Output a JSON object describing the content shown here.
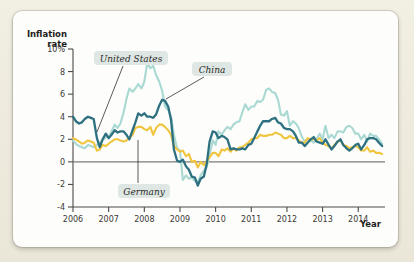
{
  "chart_data": {
    "type": "line",
    "title": "",
    "xlabel": "Year",
    "ylabel": "Inflation rate",
    "xlim": [
      2006.0,
      2014.75
    ],
    "ylim": [
      -4,
      10
    ],
    "grid": false,
    "legend_position": "inline-annotations",
    "y_ticks": [
      "10%",
      "8",
      "6",
      "4",
      "2",
      "0",
      "-2",
      "-4"
    ],
    "y_tick_values": [
      10,
      8,
      6,
      4,
      2,
      0,
      -2,
      -4
    ],
    "x_ticks": [
      "2006",
      "2007",
      "2008",
      "2009",
      "2010",
      "2011",
      "2012",
      "2013",
      "2014"
    ],
    "x_tick_values": [
      2006,
      2007,
      2008,
      2009,
      2010,
      2011,
      2012,
      2013,
      2014
    ],
    "annotations": [
      {
        "label": "United States",
        "series": "United States"
      },
      {
        "label": "China",
        "series": "China"
      },
      {
        "label": "Germany",
        "series": "Germany"
      }
    ],
    "series": [
      {
        "name": "United States",
        "color": "#2d7080",
        "x": [
          2006.0,
          2006.08,
          2006.17,
          2006.25,
          2006.33,
          2006.42,
          2006.5,
          2006.58,
          2006.67,
          2006.75,
          2006.83,
          2006.92,
          2007.0,
          2007.08,
          2007.17,
          2007.25,
          2007.33,
          2007.42,
          2007.5,
          2007.58,
          2007.67,
          2007.75,
          2007.83,
          2007.92,
          2008.0,
          2008.08,
          2008.17,
          2008.25,
          2008.33,
          2008.42,
          2008.5,
          2008.58,
          2008.67,
          2008.75,
          2008.83,
          2008.92,
          2009.0,
          2009.08,
          2009.17,
          2009.25,
          2009.33,
          2009.42,
          2009.5,
          2009.58,
          2009.67,
          2009.75,
          2009.83,
          2009.92,
          2010.0,
          2010.08,
          2010.17,
          2010.25,
          2010.33,
          2010.42,
          2010.5,
          2010.58,
          2010.67,
          2010.75,
          2010.83,
          2010.92,
          2011.0,
          2011.08,
          2011.17,
          2011.25,
          2011.33,
          2011.42,
          2011.5,
          2011.58,
          2011.67,
          2011.75,
          2011.83,
          2011.92,
          2012.0,
          2012.08,
          2012.17,
          2012.25,
          2012.33,
          2012.42,
          2012.5,
          2012.58,
          2012.67,
          2012.75,
          2012.83,
          2012.92,
          2013.0,
          2013.08,
          2013.17,
          2013.25,
          2013.33,
          2013.42,
          2013.5,
          2013.58,
          2013.67,
          2013.75,
          2013.83,
          2013.92,
          2014.0,
          2014.08,
          2014.17,
          2014.25,
          2014.33,
          2014.42,
          2014.5,
          2014.58,
          2014.67
        ],
        "values": [
          4.0,
          3.6,
          3.4,
          3.5,
          3.8,
          4.0,
          3.9,
          3.8,
          2.1,
          1.3,
          2.0,
          2.5,
          2.1,
          2.4,
          2.8,
          2.6,
          2.7,
          2.7,
          2.4,
          2.0,
          2.8,
          3.5,
          4.3,
          4.1,
          4.3,
          4.0,
          4.0,
          3.9,
          4.2,
          5.0,
          5.5,
          5.4,
          4.9,
          3.7,
          1.1,
          0.1,
          0.0,
          0.2,
          -0.4,
          -0.7,
          -1.3,
          -1.4,
          -2.1,
          -1.5,
          -1.3,
          -0.2,
          1.8,
          2.7,
          2.6,
          2.1,
          2.3,
          2.2,
          2.0,
          1.1,
          1.2,
          1.1,
          1.1,
          1.2,
          1.1,
          1.5,
          1.6,
          2.1,
          2.7,
          3.2,
          3.6,
          3.6,
          3.6,
          3.8,
          3.9,
          3.5,
          3.4,
          3.0,
          2.9,
          2.9,
          2.7,
          2.3,
          1.7,
          1.7,
          1.4,
          1.7,
          2.0,
          2.2,
          1.8,
          1.7,
          1.6,
          2.0,
          1.5,
          1.1,
          1.4,
          1.8,
          2.0,
          1.5,
          1.2,
          1.0,
          1.2,
          1.5,
          1.6,
          1.1,
          1.5,
          2.0,
          2.1,
          2.1,
          2.0,
          1.7,
          1.4
        ]
      },
      {
        "name": "China",
        "color": "#a9d9d2",
        "x": [
          2006.0,
          2006.08,
          2006.17,
          2006.25,
          2006.33,
          2006.42,
          2006.5,
          2006.58,
          2006.67,
          2006.75,
          2006.83,
          2006.92,
          2007.0,
          2007.08,
          2007.17,
          2007.25,
          2007.33,
          2007.42,
          2007.5,
          2007.58,
          2007.67,
          2007.75,
          2007.83,
          2007.92,
          2008.0,
          2008.08,
          2008.17,
          2008.25,
          2008.33,
          2008.42,
          2008.5,
          2008.58,
          2008.67,
          2008.75,
          2008.83,
          2008.92,
          2009.0,
          2009.08,
          2009.17,
          2009.25,
          2009.33,
          2009.42,
          2009.5,
          2009.58,
          2009.67,
          2009.75,
          2009.83,
          2009.92,
          2010.0,
          2010.08,
          2010.17,
          2010.25,
          2010.33,
          2010.42,
          2010.5,
          2010.58,
          2010.67,
          2010.75,
          2010.83,
          2010.92,
          2011.0,
          2011.08,
          2011.17,
          2011.25,
          2011.33,
          2011.42,
          2011.5,
          2011.58,
          2011.67,
          2011.75,
          2011.83,
          2011.92,
          2012.0,
          2012.08,
          2012.17,
          2012.25,
          2012.33,
          2012.42,
          2012.5,
          2012.58,
          2012.67,
          2012.75,
          2012.83,
          2012.92,
          2013.0,
          2013.08,
          2013.17,
          2013.25,
          2013.33,
          2013.42,
          2013.5,
          2013.58,
          2013.67,
          2013.75,
          2013.83,
          2013.92,
          2014.0,
          2014.08,
          2014.17,
          2014.25,
          2014.33,
          2014.42,
          2014.5,
          2014.58,
          2014.67
        ],
        "values": [
          1.9,
          1.6,
          1.4,
          1.3,
          1.2,
          1.5,
          1.4,
          1.3,
          1.5,
          1.7,
          1.9,
          2.2,
          2.2,
          2.7,
          3.3,
          3.0,
          3.4,
          4.4,
          5.6,
          6.5,
          6.2,
          6.5,
          6.9,
          6.5,
          7.1,
          8.7,
          8.3,
          8.5,
          7.7,
          7.1,
          6.3,
          4.9,
          4.6,
          4.0,
          2.4,
          1.2,
          1.0,
          -1.6,
          -1.2,
          -1.5,
          -1.4,
          -1.7,
          -1.8,
          -1.2,
          -0.8,
          -0.5,
          0.6,
          1.9,
          1.5,
          2.7,
          2.4,
          2.8,
          3.1,
          2.9,
          3.3,
          3.5,
          3.6,
          4.4,
          5.1,
          4.6,
          4.9,
          4.9,
          5.4,
          5.3,
          5.5,
          6.4,
          6.5,
          6.2,
          6.1,
          5.5,
          4.2,
          4.1,
          4.5,
          3.2,
          3.6,
          3.4,
          3.0,
          2.2,
          1.8,
          2.0,
          1.9,
          1.7,
          2.0,
          2.5,
          2.0,
          3.2,
          2.1,
          2.4,
          2.1,
          2.7,
          2.7,
          2.6,
          3.1,
          3.2,
          3.0,
          2.5,
          2.5,
          2.0,
          2.4,
          1.8,
          2.5,
          2.3,
          2.3,
          2.0,
          1.6
        ]
      },
      {
        "name": "Germany",
        "color": "#f0c53f",
        "x": [
          2006.0,
          2006.08,
          2006.17,
          2006.25,
          2006.33,
          2006.42,
          2006.5,
          2006.58,
          2006.67,
          2006.75,
          2006.83,
          2006.92,
          2007.0,
          2007.08,
          2007.17,
          2007.25,
          2007.33,
          2007.42,
          2007.5,
          2007.58,
          2007.67,
          2007.75,
          2007.83,
          2007.92,
          2008.0,
          2008.08,
          2008.17,
          2008.25,
          2008.33,
          2008.42,
          2008.5,
          2008.58,
          2008.67,
          2008.75,
          2008.83,
          2008.92,
          2009.0,
          2009.08,
          2009.17,
          2009.25,
          2009.33,
          2009.42,
          2009.5,
          2009.58,
          2009.67,
          2009.75,
          2009.83,
          2009.92,
          2010.0,
          2010.08,
          2010.17,
          2010.25,
          2010.33,
          2010.42,
          2010.5,
          2010.58,
          2010.67,
          2010.75,
          2010.83,
          2010.92,
          2011.0,
          2011.08,
          2011.17,
          2011.25,
          2011.33,
          2011.42,
          2011.5,
          2011.58,
          2011.67,
          2011.75,
          2011.83,
          2011.92,
          2012.0,
          2012.08,
          2012.17,
          2012.25,
          2012.33,
          2012.42,
          2012.5,
          2012.58,
          2012.67,
          2012.75,
          2012.83,
          2012.92,
          2013.0,
          2013.08,
          2013.17,
          2013.25,
          2013.33,
          2013.42,
          2013.5,
          2013.58,
          2013.67,
          2013.75,
          2013.83,
          2013.92,
          2014.0,
          2014.08,
          2014.17,
          2014.25,
          2014.33,
          2014.42,
          2014.5,
          2014.58,
          2014.67
        ],
        "values": [
          2.1,
          2.0,
          1.8,
          1.6,
          1.7,
          1.9,
          1.8,
          1.7,
          1.0,
          1.1,
          1.5,
          1.4,
          1.6,
          1.8,
          2.0,
          2.0,
          1.9,
          1.8,
          1.9,
          2.1,
          2.4,
          3.0,
          3.1,
          3.1,
          2.9,
          2.8,
          3.1,
          2.4,
          3.0,
          3.3,
          3.3,
          3.1,
          2.8,
          2.4,
          1.4,
          1.1,
          0.9,
          1.0,
          0.5,
          0.7,
          0.0,
          0.1,
          -0.5,
          0.0,
          -0.3,
          0.1,
          0.4,
          0.8,
          0.8,
          0.5,
          1.1,
          1.0,
          1.2,
          0.9,
          1.2,
          1.0,
          1.3,
          1.3,
          1.5,
          1.7,
          2.0,
          2.1,
          2.1,
          2.4,
          2.3,
          2.3,
          2.4,
          2.4,
          2.6,
          2.5,
          2.4,
          2.1,
          2.1,
          2.3,
          2.1,
          2.1,
          1.9,
          1.7,
          1.7,
          2.1,
          2.0,
          2.0,
          1.9,
          2.1,
          1.7,
          1.5,
          1.4,
          1.2,
          1.5,
          1.8,
          1.9,
          1.5,
          1.4,
          1.2,
          1.3,
          1.4,
          1.3,
          1.0,
          1.0,
          1.3,
          0.9,
          1.0,
          0.8,
          0.8,
          0.7
        ]
      }
    ]
  },
  "axes": {
    "y_label_line1": "Inflation",
    "y_label_line2": "rate",
    "x_label": "Year"
  },
  "annotations": {
    "us": "United States",
    "china": "China",
    "germany": "Germany"
  },
  "colors": {
    "united_states": "#2d7080",
    "china": "#a9d9d2",
    "germany": "#f0c53f",
    "label_chip_bg": "#dfe7e4",
    "card_bg": "#fdfdfb",
    "page_bg": "#efece0",
    "axis": "#4c4a46"
  }
}
